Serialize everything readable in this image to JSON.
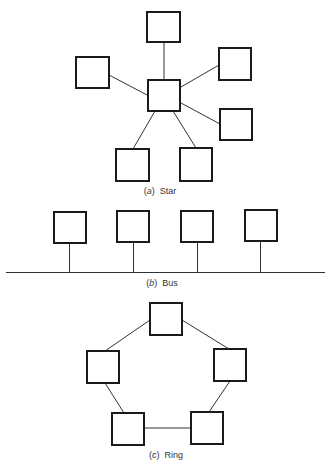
{
  "diagrams": {
    "star": {
      "prefix": "(a)",
      "letter": "a",
      "name": "Star",
      "hub": "central-node",
      "node_count": 7
    },
    "bus": {
      "prefix": "(b)",
      "letter": "b",
      "name": "Bus",
      "node_count": 4
    },
    "ring": {
      "prefix": "(c)",
      "letter": "c",
      "name": "Ring",
      "node_count": 5
    }
  },
  "colors": {
    "stroke": "#1a1a1a",
    "line": "#333333",
    "background": "#ffffff"
  }
}
